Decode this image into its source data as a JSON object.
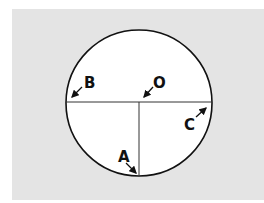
{
  "figure": {
    "type": "circle-diagram",
    "background_color": "#e4e4e4",
    "circle_fill": "#ffffff",
    "stroke_color": "#111111",
    "labels": {
      "B": "B",
      "O": "O",
      "C": "C",
      "A": "A"
    }
  }
}
